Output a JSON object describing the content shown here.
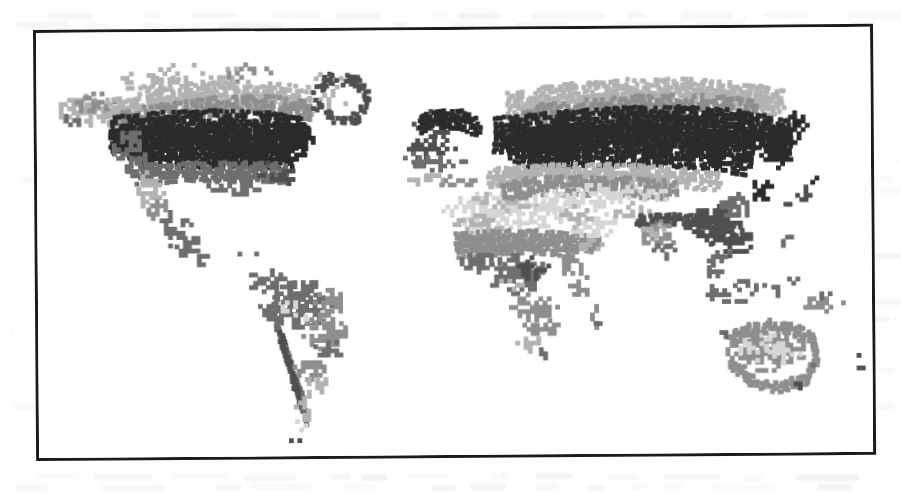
{
  "document": {
    "kind": "scanned-figure",
    "figure_type": "world-biome-map",
    "title_visible": "",
    "caption_visible": "",
    "legend_visible": "",
    "axis_labels_visible": "",
    "notes": "Grayscale raster world map inside a thin black rectangular frame; no printed labels, legend or axis text are visible in the scan.",
    "background_color": "#fefefe",
    "frame": {
      "border_color": "#1b1b1b",
      "border_width_px": 3,
      "left_px": 33,
      "top_px": 30,
      "width_px": 840,
      "height_px": 431,
      "skew_degrees": -0.42
    }
  },
  "map": {
    "projection_hint": "equirectangular",
    "water_color": "#ffffff",
    "land_classes": [
      {
        "id": "c1",
        "label": "class-1-darkest",
        "color": "#2b2b2b"
      },
      {
        "id": "c2",
        "label": "class-2-dark",
        "color": "#4f4f4f"
      },
      {
        "id": "c3",
        "label": "class-3-medium-dark",
        "color": "#6e6e6e"
      },
      {
        "id": "c4",
        "label": "class-4-medium",
        "color": "#8e8e8e"
      },
      {
        "id": "c5",
        "label": "class-5-light",
        "color": "#b2b2b2"
      },
      {
        "id": "c6",
        "label": "class-6-lightest",
        "color": "#d6d6d6"
      }
    ],
    "regions": [
      {
        "name": "north-america",
        "label": "North America"
      },
      {
        "name": "greenland",
        "label": "Greenland"
      },
      {
        "name": "south-america",
        "label": "South America"
      },
      {
        "name": "europe",
        "label": "Europe"
      },
      {
        "name": "africa",
        "label": "Africa"
      },
      {
        "name": "asia",
        "label": "Asia"
      },
      {
        "name": "southeast-asia-islands",
        "label": "Southeast Asian Islands"
      },
      {
        "name": "australia",
        "label": "Australia"
      },
      {
        "name": "new-zealand",
        "label": "New Zealand"
      }
    ]
  },
  "chart_data": {
    "type": "heatmap",
    "title": "",
    "xlabel": "",
    "ylabel": "",
    "legend_position": "none",
    "grid": false,
    "colormap": [
      "#ffffff",
      "#d6d6d6",
      "#b2b2b2",
      "#8e8e8e",
      "#6e6e6e",
      "#4f4f4f",
      "#2b2b2b"
    ],
    "value_levels": [
      0,
      1,
      2,
      3,
      4,
      5,
      6
    ],
    "class_notes": [
      "Darkest band runs across northern Canada and Siberia (boreal / taiga belt).",
      "Light and lightest tones dominate the Sahara, Arabian Peninsula and central Australia (arid / desert).",
      "Medium tones cover Amazonia, central Africa and southeast Asia.",
      "Greenland and high Arctic read as white (unclassified / ice)."
    ]
  },
  "render": {
    "ghost_text_opacity": 0.055,
    "speckle_opacity": 0.2
  }
}
